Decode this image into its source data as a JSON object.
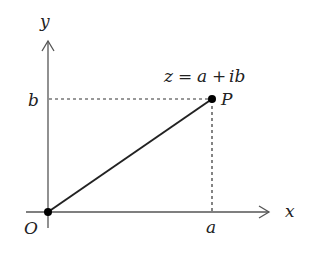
{
  "diagram": {
    "axes": {
      "x_label": "x",
      "y_label": "y"
    },
    "labels": {
      "origin": "O",
      "point": "P",
      "real_part": "a",
      "imag_part": "b",
      "equation_lhs": "z",
      "equation_eq": "=",
      "equation_a": "a",
      "equation_plus": "+",
      "equation_ib": "ib"
    },
    "colors": {
      "axis": "#555555",
      "segment": "#222222",
      "dashed": "#333333",
      "point": "#000000"
    }
  }
}
